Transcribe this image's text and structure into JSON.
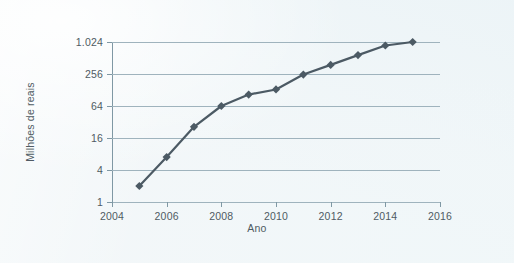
{
  "chart_data": {
    "type": "line",
    "title": "",
    "xlabel": "Ano",
    "ylabel": "Milhões de reais",
    "x": [
      2005,
      2006,
      2007,
      2008,
      2009,
      2010,
      2011,
      2012,
      2013,
      2014,
      2015
    ],
    "values": [
      2,
      7,
      26,
      64,
      105,
      131,
      250,
      380,
      580,
      880,
      1024
    ],
    "series": [
      {
        "name": "Milhões de reais",
        "values": [
          2,
          7,
          26,
          64,
          105,
          131,
          250,
          380,
          580,
          880,
          1024
        ]
      }
    ],
    "xlim": [
      2004,
      2016
    ],
    "xticks": [
      2004,
      2006,
      2008,
      2010,
      2012,
      2014,
      2016
    ],
    "xtick_labels": [
      "2004",
      "2006",
      "2008",
      "2010",
      "2012",
      "2014",
      "2016"
    ],
    "ylim": [
      1,
      1024
    ],
    "yscale": "log4",
    "yticks": [
      1,
      4,
      16,
      64,
      256,
      1024
    ],
    "ytick_labels": [
      "1",
      "4",
      "16",
      "64",
      "256",
      "1.024"
    ],
    "grid": "horizontal",
    "legend": "none",
    "marker": "diamond",
    "line_color": "#4c5a64",
    "marker_color": "#4c5a64",
    "grid_color": "#9fb3bd",
    "axis_color": "#7f98a4",
    "text_color": "#4f5b63",
    "background_color": "#f1f6f8"
  }
}
